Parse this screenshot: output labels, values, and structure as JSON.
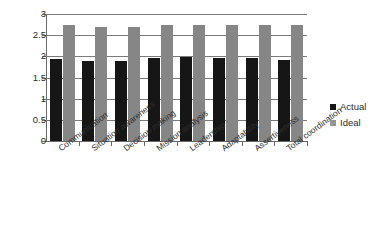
{
  "chart_data": {
    "type": "bar",
    "title": "",
    "xlabel": "",
    "ylabel": "",
    "ylim": [
      0,
      3
    ],
    "yticks": [
      "0",
      "0.5",
      "1",
      "1.5",
      "2",
      "2.5",
      "3"
    ],
    "grid": true,
    "legend_position": "right",
    "categories": [
      "Communication",
      "Situation awareness",
      "Decision making",
      "Mission analysis",
      "Leadership",
      "Adaptability",
      "Assertiveness",
      "Total coordination"
    ],
    "series": [
      {
        "name": "Actual",
        "color": "#161616",
        "values": [
          1.93,
          1.89,
          1.89,
          1.95,
          1.98,
          1.95,
          1.95,
          1.92
        ]
      },
      {
        "name": "Ideal",
        "color": "#868686",
        "values": [
          2.74,
          2.69,
          2.69,
          2.75,
          2.75,
          2.75,
          2.75,
          2.73
        ]
      }
    ]
  },
  "legend": {
    "items": [
      {
        "label": "Actual",
        "swatch": "legend-swatch-actual"
      },
      {
        "label": "Ideal",
        "swatch": "legend-swatch-ideal"
      }
    ]
  }
}
